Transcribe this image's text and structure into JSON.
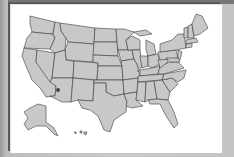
{
  "map": {
    "title": "United States map",
    "state_fill": "#c8c8c8",
    "state_stroke": "#3a3a3a",
    "background": "#ffffff",
    "frame": "#bdbdbd",
    "markers": [
      {
        "label": "Arizona location marker",
        "state": "AZ",
        "color": "#444444"
      }
    ],
    "insets": [
      "Alaska",
      "Hawaii"
    ]
  }
}
